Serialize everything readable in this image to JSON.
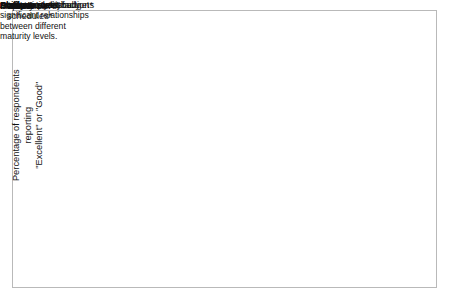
{
  "figure": {
    "border_color": "#b9b9b9",
    "background": "#ffffff",
    "ink": "#111111",
    "grid_color": "#cccccc"
  },
  "axes": {
    "y_label_line1": "Percentage of respondents reporting",
    "y_label_line2": "\"Excellent\" or \"Good\"",
    "x_label": "Maturity Level",
    "y_ticks": [
      "100%",
      "80%",
      "60%",
      "40%",
      "20%"
    ],
    "y_tick_values": [
      100,
      80,
      60,
      40,
      20
    ],
    "y_minor_values": [
      90,
      70,
      50,
      30
    ],
    "x_ticks": [
      "Initial",
      "Repeatable",
      "Defined"
    ],
    "axis_break": true
  },
  "legend": {
    "items": [
      {
        "label": "Product quality*",
        "style": "short-dash"
      },
      {
        "label": "Customer satisfaction*",
        "style": "solid"
      },
      {
        "label": "Productivity*",
        "style": "long-dash"
      },
      {
        "label": "Ability to meet",
        "label2": "schedules*",
        "style": "long-dash"
      },
      {
        "label": "Ability to meet budgets",
        "style": "solid-thick"
      },
      {
        "label": "Staff morale*",
        "style": "dotted"
      }
    ]
  },
  "footnote": {
    "lines": [
      "* Indicate statistically",
      "significant relationships",
      "between different",
      "maturity levels."
    ]
  },
  "chart_data": {
    "type": "line",
    "title": "",
    "xlabel": "Maturity Level",
    "ylabel": "Percentage of respondents reporting \"Excellent\" or \"Good\"",
    "categories": [
      "Initial",
      "Repeatable",
      "Defined"
    ],
    "ylim": [
      18,
      102
    ],
    "ytick_labels": [
      "20%",
      "40%",
      "60%",
      "80%",
      "100%"
    ],
    "grid": true,
    "legend_position": "right",
    "axis_break_below": 20,
    "series": [
      {
        "name": "Product quality*",
        "values": [
          77,
          90,
          100
        ],
        "style": "short-dash"
      },
      {
        "name": "Customer satisfaction*",
        "values": [
          77,
          70,
          100
        ],
        "style": "solid"
      },
      {
        "name": "Productivity*",
        "values": [
          55,
          70,
          89
        ],
        "style": "long-dash"
      },
      {
        "name": "Ability to meet schedules*",
        "values": [
          41,
          57,
          81
        ],
        "style": "long-dash"
      },
      {
        "name": "Ability to meet budgets",
        "values": [
          40,
          57,
          69
        ],
        "style": "solid-thick"
      },
      {
        "name": "Staff morale*",
        "values": [
          22,
          50,
          61
        ],
        "style": "dotted"
      }
    ]
  }
}
